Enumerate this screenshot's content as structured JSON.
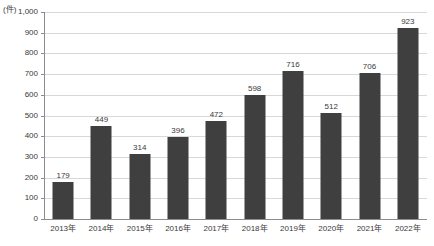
{
  "chart_data": {
    "type": "bar",
    "title": "",
    "subtitle": "",
    "unit_label": "(件)",
    "xlabel": "",
    "ylabel": "",
    "ylim": [
      0,
      1000
    ],
    "grid": true,
    "legend": false,
    "legend_position": "none",
    "bar_color": "#3f3f3f",
    "gridline_color": "#d8d8d8",
    "axis_color": "#8c8c8c",
    "categories": [
      "2013年",
      "2014年",
      "2015年",
      "2016年",
      "2017年",
      "2018年",
      "2019年",
      "2020年",
      "2021年",
      "2022年"
    ],
    "values": [
      179,
      449,
      314,
      396,
      472,
      598,
      716,
      512,
      706,
      923
    ],
    "value_labels": [
      "179",
      "449",
      "314",
      "396",
      "472",
      "598",
      "716",
      "512",
      "706",
      "923"
    ],
    "ytick_values": [
      0,
      100,
      200,
      300,
      400,
      500,
      600,
      700,
      800,
      900,
      1000
    ],
    "ytick_labels": [
      "0",
      "100",
      "200",
      "300",
      "400",
      "500",
      "600",
      "700",
      "800",
      "900",
      "1,000"
    ]
  }
}
